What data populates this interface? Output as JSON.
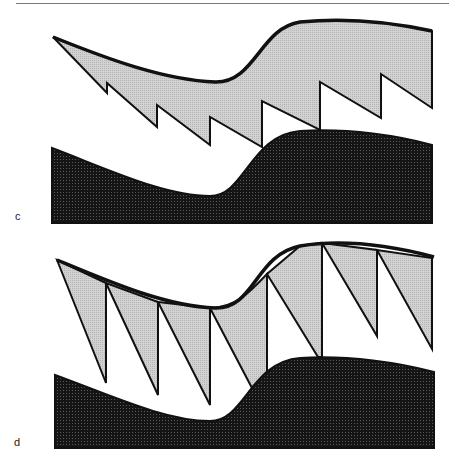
{
  "figure": {
    "panels": [
      {
        "label": "c",
        "description": "Gray shaded sawtooth layer with jagged lower edge above dark wavy base"
      },
      {
        "label": "d",
        "description": "Gray triangular wedges hanging from curved upper line above dark wavy base"
      }
    ],
    "colors": {
      "light_fill": "#c8c8c8",
      "dark_fill": "#1a1a1a",
      "stroke": "#111111",
      "background": "#ffffff"
    }
  }
}
